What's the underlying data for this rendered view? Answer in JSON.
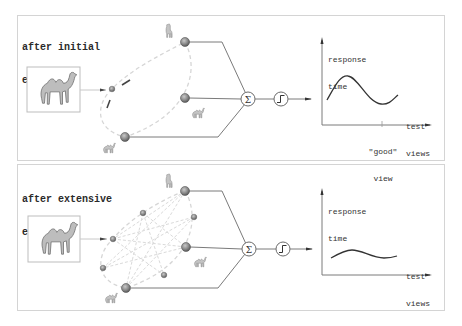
{
  "panels": [
    {
      "title_line1": "after initial",
      "title_line2": "exposure",
      "input_image": "camel-image",
      "network": {
        "big_nodes": 3,
        "small_nodes": 1,
        "sum_symbol": "Σ",
        "activation_symbol": "step-function"
      },
      "plot": {
        "ylabel_line1": "response",
        "ylabel_line2": "time",
        "xlabel_line1": "test",
        "xlabel_line2": "views",
        "tick_label_line1": "\"good\"",
        "tick_label_line2": "view"
      }
    },
    {
      "title_line1": "after extensive",
      "title_line2": "exposure",
      "input_image": "camel-image",
      "network": {
        "big_nodes": 3,
        "small_nodes": 5,
        "sum_symbol": "Σ",
        "activation_symbol": "step-function"
      },
      "plot": {
        "ylabel_line1": "response",
        "ylabel_line2": "time",
        "xlabel_line1": "test",
        "xlabel_line2": "views"
      }
    }
  ],
  "colors": {
    "line": "#7a7a7a",
    "node_fill": "#8a8a8a",
    "node_stroke": "#555555",
    "dashed": "#d0d0d0",
    "text": "#2a2a2a",
    "curve": "#333333"
  }
}
